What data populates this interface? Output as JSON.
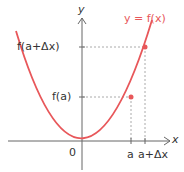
{
  "diagram": {
    "curve_label": "y = f(x)",
    "axes": {
      "x_label": "x",
      "y_label": "y",
      "origin_label": "0"
    },
    "y_ticks": [
      {
        "label": "f(a+Δx)"
      },
      {
        "label": "f(a)"
      }
    ],
    "x_ticks": [
      {
        "label": "a"
      },
      {
        "label": "a+Δx"
      }
    ],
    "colors": {
      "curve": "#e8575a",
      "axis": "#666666",
      "guide": "#aaaaaa",
      "text": "#333333"
    }
  }
}
